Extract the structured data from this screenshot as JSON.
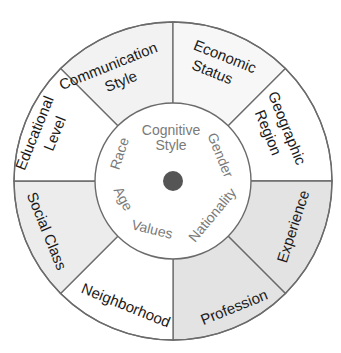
{
  "diagram": {
    "type": "concentric-wheel",
    "center_dot_color": "#555555",
    "outer_ring": {
      "segments": [
        {
          "label_lines": [
            "Communication",
            "Style"
          ],
          "fill": "#f2f2f2"
        },
        {
          "label_lines": [
            "Economic",
            "Status"
          ],
          "fill": "#f7f7f7"
        },
        {
          "label_lines": [
            "Geographic",
            "Region"
          ],
          "fill": "#ffffff"
        },
        {
          "label_lines": [
            "Experience"
          ],
          "fill": "#e3e3e3"
        },
        {
          "label_lines": [
            "Profession"
          ],
          "fill": "#e3e3e3"
        },
        {
          "label_lines": [
            "Neighborhood"
          ],
          "fill": "#ffffff"
        },
        {
          "label_lines": [
            "Social Class"
          ],
          "fill": "#ececec"
        },
        {
          "label_lines": [
            "Educational",
            "Level"
          ],
          "fill": "#ffffff"
        }
      ]
    },
    "inner_circle": {
      "labels": [
        "Cognitive",
        "Style",
        "Gender",
        "Nationality",
        "Values",
        "Age",
        "Race"
      ]
    }
  }
}
